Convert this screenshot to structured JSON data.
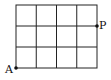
{
  "diagram": {
    "type": "grid",
    "columns": 4,
    "rows": 3,
    "points": [
      {
        "label": "A",
        "position": "bottom-left corner"
      },
      {
        "label": "P",
        "position": "right edge, top grid line below border"
      }
    ]
  },
  "labels": {
    "a": "A",
    "p": "P"
  }
}
